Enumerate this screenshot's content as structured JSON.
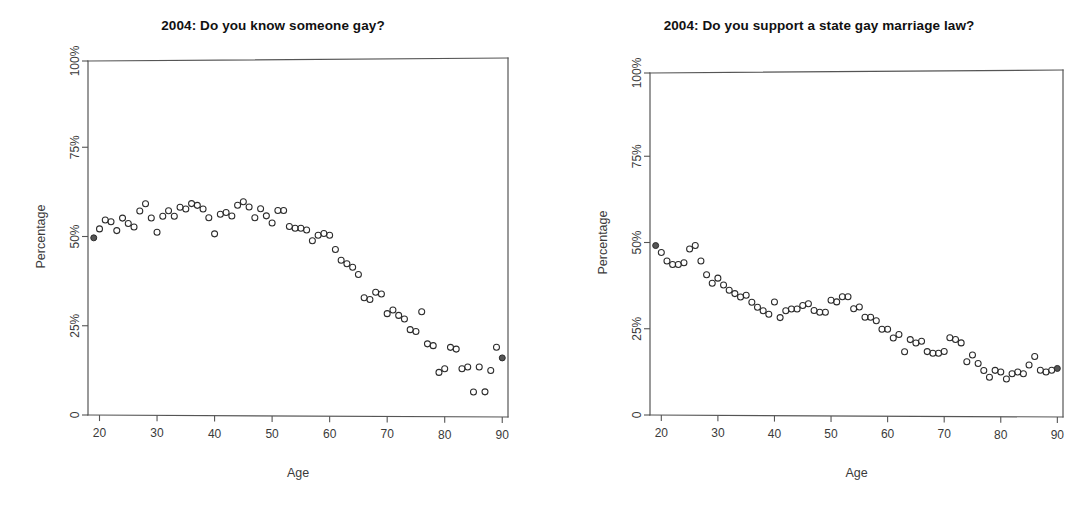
{
  "figure": {
    "background_color": "#ffffff",
    "point_color": "#2b2b2b",
    "axis_color": "#555555",
    "panel_count": 2
  },
  "panels": [
    {
      "id": "left",
      "title": "2004: Do you know someone gay?",
      "xlabel": "Age",
      "ylabel": "Percentage"
    },
    {
      "id": "right",
      "title": "2004: Do you support a state gay marriage law?",
      "xlabel": "Age",
      "ylabel": "Percentage"
    }
  ],
  "axes": {
    "x_ticks": [
      20,
      30,
      40,
      50,
      60,
      70,
      80,
      90
    ],
    "x_tick_labels": [
      "20",
      "30",
      "40",
      "50",
      "60",
      "70",
      "80",
      "90"
    ],
    "y_ticks": [
      0,
      25,
      50,
      75,
      100
    ],
    "y_tick_labels": [
      "0",
      "25%",
      "50%",
      "75%",
      "100%"
    ],
    "xlim": [
      18,
      91
    ],
    "ylim": [
      0,
      100
    ],
    "grid": false
  },
  "chart_data": [
    {
      "type": "scatter",
      "title": "2004: Do you know someone gay?",
      "xlabel": "Age",
      "ylabel": "Percentage",
      "xlim": [
        18,
        91
      ],
      "ylim": [
        0,
        100
      ],
      "grid": false,
      "legend": null,
      "marker": "open-circle",
      "x": [
        19,
        20,
        21,
        22,
        23,
        24,
        25,
        26,
        27,
        28,
        29,
        30,
        31,
        32,
        33,
        34,
        35,
        36,
        37,
        38,
        39,
        40,
        41,
        42,
        43,
        44,
        45,
        46,
        47,
        48,
        49,
        50,
        51,
        52,
        53,
        54,
        55,
        56,
        57,
        58,
        59,
        60,
        61,
        62,
        63,
        64,
        65,
        66,
        67,
        68,
        69,
        70,
        71,
        72,
        73,
        74,
        75,
        76,
        77,
        78,
        79,
        80,
        81,
        82,
        83,
        84,
        85,
        86,
        87,
        88,
        89,
        90
      ],
      "y": [
        50.0,
        52.5,
        55.0,
        54.5,
        52.0,
        55.5,
        54.0,
        53.0,
        57.5,
        59.5,
        55.5,
        51.5,
        56.0,
        57.5,
        56.0,
        58.5,
        58.0,
        59.5,
        59.0,
        58.0,
        55.5,
        51.0,
        56.5,
        57.0,
        56.0,
        59.0,
        60.0,
        58.5,
        55.5,
        58.0,
        56.0,
        54.0,
        57.5,
        57.5,
        53.0,
        52.5,
        52.5,
        52.0,
        49.0,
        50.5,
        51.0,
        50.5,
        46.5,
        43.5,
        42.5,
        41.5,
        39.5,
        33.0,
        32.5,
        34.5,
        34.0,
        28.5,
        29.5,
        28.0,
        27.0,
        24.0,
        23.5,
        29.0,
        20.0,
        19.5,
        12.0,
        13.0,
        19.0,
        18.5,
        13.0,
        13.5,
        6.5,
        13.5,
        6.5,
        12.5,
        19.0,
        16.0
      ],
      "annotations": [
        {
          "text": "values peak near 58-60% for ages 28-50",
          "kind": "trend-note"
        },
        {
          "text": "declines steadily after age 60 to roughly 13-19% by age 90",
          "kind": "trend-note"
        }
      ]
    },
    {
      "type": "scatter",
      "title": "2004: Do you support a state gay marriage law?",
      "xlabel": "Age",
      "ylabel": "Percentage",
      "xlim": [
        18,
        91
      ],
      "ylim": [
        0,
        100
      ],
      "grid": false,
      "legend": null,
      "marker": "open-circle",
      "x": [
        19,
        20,
        21,
        22,
        23,
        24,
        25,
        26,
        27,
        28,
        29,
        30,
        31,
        32,
        33,
        34,
        35,
        36,
        37,
        38,
        39,
        40,
        41,
        42,
        43,
        44,
        45,
        46,
        47,
        48,
        49,
        50,
        51,
        52,
        53,
        54,
        55,
        56,
        57,
        58,
        59,
        60,
        61,
        62,
        63,
        64,
        65,
        66,
        67,
        68,
        69,
        70,
        71,
        72,
        73,
        74,
        75,
        76,
        77,
        78,
        79,
        80,
        81,
        82,
        83,
        84,
        85,
        86,
        87,
        88,
        89,
        90
      ],
      "y": [
        49.5,
        47.5,
        45.0,
        44.0,
        44.0,
        44.5,
        48.5,
        49.5,
        45.0,
        41.0,
        38.5,
        40.0,
        38.0,
        36.5,
        35.5,
        34.5,
        35.0,
        33.0,
        31.5,
        30.5,
        29.5,
        33.0,
        28.5,
        30.5,
        31.0,
        31.0,
        32.0,
        32.5,
        30.5,
        30.0,
        30.0,
        33.5,
        33.0,
        34.5,
        34.5,
        31.0,
        31.5,
        28.5,
        28.5,
        27.5,
        25.0,
        25.0,
        22.5,
        23.5,
        18.5,
        22.0,
        21.0,
        21.5,
        18.5,
        18.0,
        18.0,
        18.5,
        22.5,
        22.0,
        21.0,
        15.5,
        17.5,
        15.0,
        13.0,
        11.0,
        13.0,
        12.5,
        10.5,
        12.0,
        12.5,
        12.0,
        14.5,
        17.0,
        13.0,
        12.5,
        13.0,
        13.5
      ],
      "annotations": [
        {
          "text": "starts near 48-50% at age 19 and declines",
          "kind": "trend-note"
        },
        {
          "text": "plateau around 30-34% for ages 41-55",
          "kind": "trend-note"
        },
        {
          "text": "flattens near 11-15% beyond age 77",
          "kind": "trend-note"
        }
      ]
    }
  ]
}
